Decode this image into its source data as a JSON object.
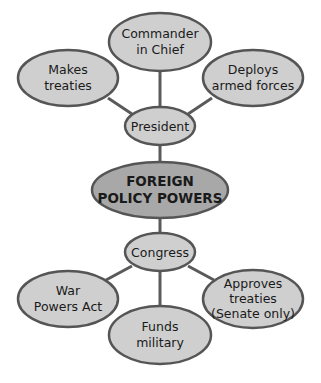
{
  "diagram": {
    "title": "FOREIGN POLICY POWERS",
    "colors": {
      "node_fill": "#cfcfcf",
      "center_fill": "#a8a8a8",
      "stroke": "#555555",
      "line": "#5a5a5a",
      "text": "#1a1a1a"
    },
    "center": {
      "line1": "FOREIGN",
      "line2": "POLICY POWERS"
    },
    "president": {
      "label": "President",
      "powers": [
        {
          "line1": "Makes",
          "line2": "treaties"
        },
        {
          "line1": "Commander",
          "line2": "in Chief"
        },
        {
          "line1": "Deploys",
          "line2": "armed forces"
        }
      ]
    },
    "congress": {
      "label": "Congress",
      "powers": [
        {
          "line1": "War",
          "line2": "Powers Act"
        },
        {
          "line1": "Funds",
          "line2": "military"
        },
        {
          "line1": "Approves",
          "line2": "treaties",
          "line3": "(Senate only)"
        }
      ]
    }
  }
}
